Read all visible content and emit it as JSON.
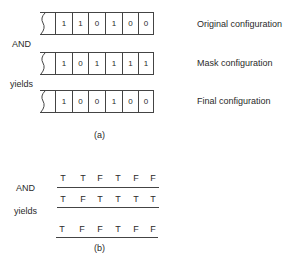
{
  "part_a": {
    "caption": "(a)",
    "rows": [
      {
        "label": "Original configuration",
        "bits": [
          "1",
          "1",
          "0",
          "1",
          "0",
          "0"
        ]
      },
      {
        "label": "Mask configuration",
        "bits": [
          "1",
          "0",
          "1",
          "1",
          "1",
          "1"
        ]
      },
      {
        "label": "Final configuration",
        "bits": [
          "1",
          "0",
          "0",
          "1",
          "0",
          "0"
        ]
      }
    ],
    "operator_label": "AND",
    "result_label": "yields"
  },
  "part_b": {
    "caption": "(b)",
    "rows": [
      [
        "T",
        "T",
        "F",
        "T",
        "F",
        "F"
      ],
      [
        "T",
        "F",
        "T",
        "T",
        "T",
        "T"
      ],
      [
        "T",
        "F",
        "F",
        "T",
        "F",
        "F"
      ]
    ],
    "operator_label": "AND",
    "result_label": "yields"
  }
}
